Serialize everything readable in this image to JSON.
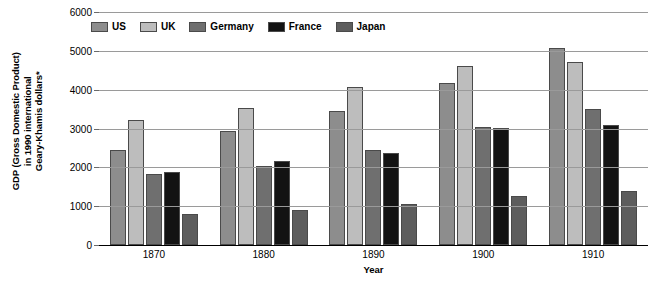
{
  "chart_data": {
    "type": "bar",
    "title": "",
    "subtitle": "",
    "xlabel": "Year",
    "ylabel": "GDP (Gross Domestic Product)\nin 1990 international\nGeary-Khamis dollars*",
    "categories": [
      "1870",
      "1880",
      "1890",
      "1900",
      "1910"
    ],
    "series": [
      {
        "name": "US",
        "color": "#8d8d8d",
        "values": [
          2445,
          2925,
          3455,
          4180,
          5070
        ]
      },
      {
        "name": "UK",
        "color": "#bdbdbd",
        "values": [
          3215,
          3520,
          4070,
          4600,
          4725
        ]
      },
      {
        "name": "Germany",
        "color": "#6f6f6f",
        "values": [
          1840,
          2025,
          2450,
          3050,
          3500
        ]
      },
      {
        "name": "France",
        "color": "#131313",
        "values": [
          1880,
          2175,
          2380,
          3010,
          3100
        ]
      },
      {
        "name": "Japan",
        "color": "#5d5d5d",
        "values": [
          790,
          890,
          1060,
          1250,
          1400
        ]
      }
    ],
    "ylim": [
      0,
      6000
    ],
    "yticks": [
      0,
      1000,
      2000,
      3000,
      4000,
      5000,
      6000
    ],
    "ytick_labels": [
      "0",
      "1000",
      "2000",
      "3000",
      "4000",
      "5000",
      "6000"
    ],
    "grid": true,
    "legend_position": "top-left-inside",
    "legend": [
      "US",
      "UK",
      "Germany",
      "France",
      "Japan"
    ]
  }
}
